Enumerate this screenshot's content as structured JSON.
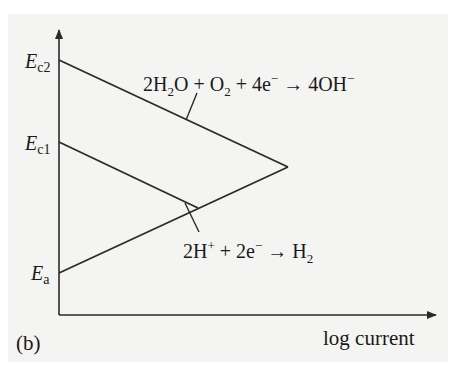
{
  "figure": {
    "panel_label": "(b)",
    "x_axis_label": "log current",
    "y_axis_labels": {
      "Ec2": {
        "main": "E",
        "sub": "c2"
      },
      "Ec1": {
        "main": "E",
        "sub": "c1"
      },
      "Ea": {
        "main": "E",
        "sub": "a"
      }
    },
    "reactions": {
      "oxygen": {
        "text": "2H₂O + O₂ + 4e⁻ → 4OH⁻",
        "parts": [
          "2H",
          "2",
          "O + O",
          "2",
          " + 4e",
          "−",
          " → 4OH",
          "−"
        ]
      },
      "hydrogen": {
        "text": "2H⁺ + 2e⁻ → H₂",
        "parts": [
          "2H",
          "+",
          " + 2e",
          "−",
          " → H",
          "2"
        ]
      }
    },
    "colors": {
      "background": "#f4f4f2",
      "line": "#2a2a2a"
    }
  }
}
